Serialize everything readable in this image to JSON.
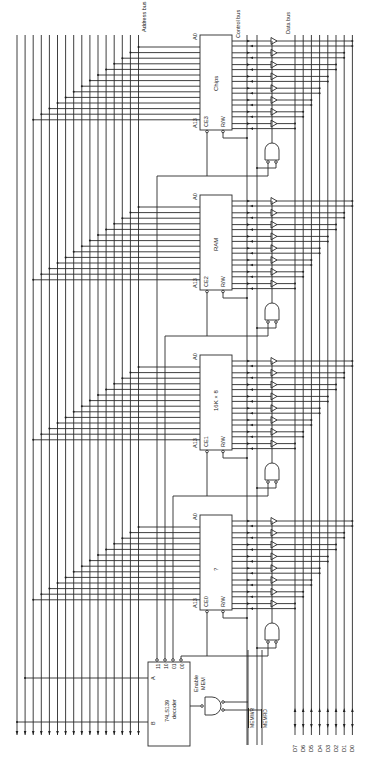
{
  "figure": {
    "orientation": "rotated-90-ccw",
    "background": "#ffffff",
    "line_color": "#2a2a2a"
  },
  "buses": {
    "address_bus_label": "Address bus",
    "control_bus_label": "Control bus",
    "data_bus_label": "Data bus",
    "address_line_count": 16,
    "data_line_count": 8
  },
  "chips": [
    {
      "id": "chip3",
      "title": "Chips",
      "ce_label": "CE3",
      "rw_label": "R/W",
      "a0_label": "A0",
      "a13_label": "A13",
      "y_top": 35,
      "y_bottom": 130
    },
    {
      "id": "chip2",
      "title": "RAM",
      "ce_label": "CE2",
      "rw_label": "R/W",
      "a0_label": "A0",
      "a13_label": "A13",
      "y_top": 195,
      "y_bottom": 290
    },
    {
      "id": "chip1",
      "title": "16K × 8",
      "ce_label": "CE1",
      "rw_label": "R/W",
      "a0_label": "A0",
      "a13_label": "A13",
      "y_top": 355,
      "y_bottom": 450
    },
    {
      "id": "chip0",
      "title": "?",
      "ce_label": "CE0",
      "rw_label": "R/W",
      "a0_label": "A0",
      "a13_label": "A13",
      "y_top": 515,
      "y_bottom": 610
    }
  ],
  "decoder": {
    "part": "74LS139",
    "subtitle": "decoder",
    "inputs": [
      "A",
      "B"
    ],
    "outputs": [
      "11",
      "10",
      "01",
      "00"
    ]
  },
  "enable_gate": {
    "label_line1": "Enable",
    "label_line2": "MEM"
  },
  "control_signals": {
    "memwr": "MEMWR",
    "memrd": "MEMRD"
  },
  "data_lines": [
    "D7",
    "D6",
    "D5",
    "D4",
    "D3",
    "D2",
    "D1",
    "D0"
  ]
}
